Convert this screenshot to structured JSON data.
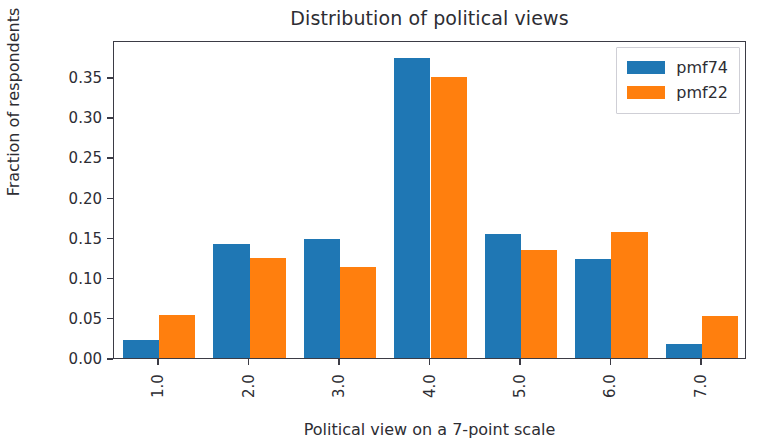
{
  "chart_data": {
    "type": "bar",
    "title": "Distribution of political views",
    "xlabel": "Political view on a 7-point scale",
    "ylabel": "Fraction of respondents",
    "categories": [
      "1.0",
      "2.0",
      "3.0",
      "4.0",
      "5.0",
      "6.0",
      "7.0"
    ],
    "series": [
      {
        "name": "pmf74",
        "color": "#1f77b4",
        "values": [
          0.022,
          0.142,
          0.148,
          0.374,
          0.154,
          0.124,
          0.018
        ]
      },
      {
        "name": "pmf22",
        "color": "#ff7f0e",
        "values": [
          0.054,
          0.125,
          0.113,
          0.35,
          0.135,
          0.157,
          0.052
        ]
      }
    ],
    "ylim": [
      0.0,
      0.3963
    ],
    "yticks": [
      0.0,
      0.05,
      0.1,
      0.15,
      0.2,
      0.25,
      0.3,
      0.35
    ],
    "ytick_labels": [
      "0.00",
      "0.05",
      "0.10",
      "0.15",
      "0.20",
      "0.25",
      "0.30",
      "0.35"
    ],
    "xtick_label_rotation": 90,
    "grid": false,
    "legend_position": "upper right",
    "legend_entries": [
      "pmf74",
      "pmf22"
    ],
    "axes_color": "#3b3b45",
    "background": "#ffffff"
  }
}
